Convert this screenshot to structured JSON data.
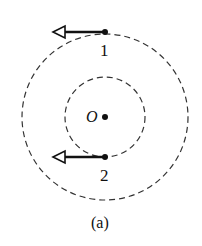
{
  "diagram": {
    "caption": "(a)",
    "center": {
      "label": "O",
      "x": 105,
      "y": 117
    },
    "circles": [
      {
        "name": "outer-orbit",
        "r": 82,
        "style": "dashed"
      },
      {
        "name": "inner-orbit",
        "r": 40,
        "style": "dashed"
      }
    ],
    "points": [
      {
        "label": "1",
        "x": 105,
        "y": 32,
        "velocity_direction": "left"
      },
      {
        "label": "2",
        "x": 105,
        "y": 157,
        "velocity_direction": "left"
      }
    ],
    "colors": {
      "ink": "#111111",
      "background": "#ffffff"
    }
  }
}
